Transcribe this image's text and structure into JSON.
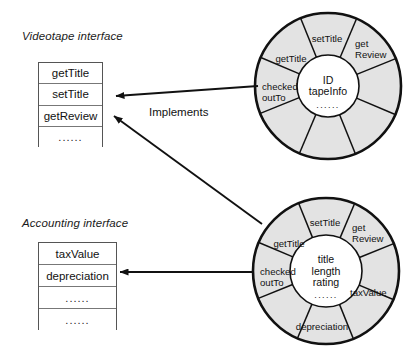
{
  "diagram": {
    "type": "uml-component-interface-diagram",
    "background": "#ffffff",
    "ink": "#111111",
    "sector_fill": "#e3e3e3"
  },
  "interfaces": [
    {
      "id": "videotape",
      "title": "Videotape interface",
      "title_pos": {
        "x": 22,
        "y": 30
      },
      "box": {
        "x": 38,
        "y": 62,
        "w": 65,
        "h": 85
      },
      "rows": [
        {
          "label": "getTitle",
          "kind": "method"
        },
        {
          "label": "setTitle",
          "kind": "method"
        },
        {
          "label": "getReview",
          "kind": "method"
        },
        {
          "label": "......",
          "kind": "ellipsis"
        }
      ]
    },
    {
      "id": "accounting",
      "title": "Accounting interface",
      "title_pos": {
        "x": 22,
        "y": 217
      },
      "box": {
        "x": 38,
        "y": 242,
        "w": 79,
        "h": 88
      },
      "rows": [
        {
          "label": "taxValue",
          "kind": "method"
        },
        {
          "label": "depreciation",
          "kind": "method"
        },
        {
          "label": "......",
          "kind": "ellipsis"
        },
        {
          "label": "......",
          "kind": "ellipsis"
        }
      ]
    }
  ],
  "components": [
    {
      "id": "videotape-component",
      "center": {
        "x": 328,
        "y": 86
      },
      "outer_r": 73,
      "inner_r": 31,
      "core": {
        "lines": [
          "ID",
          "tapeInfo"
        ],
        "dots": "......"
      },
      "sectors": [
        {
          "label": "setTitle",
          "lines": [
            "setTitle"
          ],
          "x": 327,
          "y": 42,
          "anchor": "middle"
        },
        {
          "label": "getReview",
          "lines": [
            "get",
            "Review"
          ],
          "x": 355,
          "y": 47,
          "anchor": "start"
        },
        {
          "label": "",
          "lines": [],
          "x": 0,
          "y": 0,
          "anchor": "middle"
        },
        {
          "label": "",
          "lines": [],
          "x": 0,
          "y": 0,
          "anchor": "middle"
        },
        {
          "label": "",
          "lines": [],
          "x": 0,
          "y": 0,
          "anchor": "middle"
        },
        {
          "label": "checkedOutTo",
          "lines": [
            "checked",
            "outTo"
          ],
          "x": 262,
          "y": 90,
          "anchor": "start"
        },
        {
          "label": "getTitle",
          "lines": [
            "getTitle"
          ],
          "x": 291,
          "y": 62,
          "anchor": "middle"
        }
      ]
    },
    {
      "id": "accounting-component",
      "center": {
        "x": 326,
        "y": 271
      },
      "outer_r": 73,
      "inner_r": 36,
      "core": {
        "lines": [
          "title",
          "length",
          "rating"
        ],
        "dots": "......"
      },
      "sectors": [
        {
          "label": "setTitle",
          "lines": [
            "setTitle"
          ],
          "x": 325,
          "y": 226,
          "anchor": "middle"
        },
        {
          "label": "getReview",
          "lines": [
            "get",
            "Review"
          ],
          "x": 352,
          "y": 231,
          "anchor": "start"
        },
        {
          "label": "taxValue",
          "lines": [
            "taxValue"
          ],
          "x": 350,
          "y": 296,
          "anchor": "start"
        },
        {
          "label": "depreciation",
          "lines": [
            "depreciation"
          ],
          "x": 322,
          "y": 330,
          "anchor": "middle"
        },
        {
          "label": "checkedOutTo",
          "lines": [
            "checked",
            "outTo"
          ],
          "x": 260,
          "y": 275,
          "anchor": "start"
        },
        {
          "label": "getTitle",
          "lines": [
            "getTitle"
          ],
          "x": 289,
          "y": 247,
          "anchor": "middle"
        }
      ]
    }
  ],
  "connectors": [
    {
      "id": "videotape-implements",
      "label": "Implements",
      "label_pos": {
        "x": 149,
        "y": 106
      },
      "from": {
        "x": 258,
        "y": 86
      },
      "to": {
        "x": 116,
        "y": 96
      }
    },
    {
      "id": "accounting-to-videotape",
      "label": "",
      "from": {
        "x": 262,
        "y": 224
      },
      "to": {
        "x": 114,
        "y": 116
      }
    },
    {
      "id": "accounting-implements",
      "label": "",
      "from": {
        "x": 254,
        "y": 272
      },
      "to": {
        "x": 120,
        "y": 272
      }
    }
  ]
}
